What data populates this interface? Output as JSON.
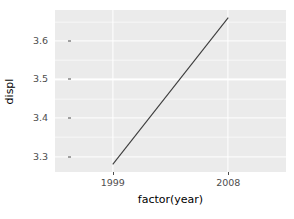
{
  "chart_data": {
    "type": "line",
    "title": "",
    "xlabel": "factor(year)",
    "ylabel": "displ",
    "categories": [
      "1999",
      "2008"
    ],
    "x": [
      1999,
      2008
    ],
    "values": [
      3.28,
      3.66
    ],
    "series": [
      {
        "name": "mean displ",
        "values": [
          3.28,
          3.66
        ]
      }
    ],
    "xtick_labels": [
      "1999",
      "2008"
    ],
    "ytick_labels": [
      "3.3",
      "3.4",
      "3.5",
      "3.6"
    ],
    "ytick_values": [
      3.3,
      3.4,
      3.5,
      3.6
    ],
    "ytick_minor_values": [
      3.25,
      3.35,
      3.45,
      3.55,
      3.65
    ],
    "ylim": [
      3.26,
      3.68
    ],
    "grid": true,
    "legend": "none",
    "panel_background": "#ebebeb",
    "gridline_major_color": "#ffffff",
    "gridline_minor_color": "#f7f7f7",
    "line_color": "#3d3d3d",
    "axis_text_color": "#4d4d4d",
    "axis_title_color": "#000000"
  }
}
